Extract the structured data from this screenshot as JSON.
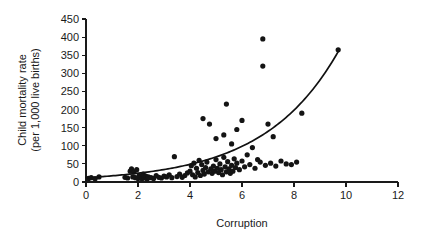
{
  "chart_data": {
    "type": "scatter",
    "title": "",
    "xlabel": "Corruption",
    "ylabel": "Child mortality rate (per 1,000 live births)",
    "ylabel_line1": "Child mortality rate",
    "ylabel_line2": "(per 1,000 live births)",
    "xlim": [
      0,
      12
    ],
    "ylim": [
      0,
      450
    ],
    "xticks": [
      0,
      2,
      4,
      6,
      8,
      10,
      12
    ],
    "yticks": [
      0,
      50,
      100,
      150,
      200,
      250,
      300,
      350,
      400,
      450
    ],
    "xticklabels": [
      "0",
      "2",
      "4",
      "6",
      "8",
      "10",
      "12"
    ],
    "yticklabels": [
      "0",
      "50",
      "100",
      "150",
      "200",
      "250",
      "300",
      "350",
      "400",
      "450"
    ],
    "grid": false,
    "legend": false,
    "point_color": "#141414",
    "curve_color": "#111111",
    "marker_size": 2.6,
    "points": [
      [
        0.1,
        10
      ],
      [
        0.2,
        12
      ],
      [
        0.35,
        9
      ],
      [
        0.5,
        14
      ],
      [
        1.5,
        13
      ],
      [
        1.6,
        11
      ],
      [
        1.7,
        30
      ],
      [
        1.75,
        36
      ],
      [
        1.8,
        14
      ],
      [
        1.85,
        28
      ],
      [
        1.9,
        12
      ],
      [
        1.95,
        34
      ],
      [
        2.0,
        10
      ],
      [
        2.05,
        18
      ],
      [
        2.1,
        13
      ],
      [
        2.15,
        9
      ],
      [
        2.2,
        22
      ],
      [
        2.25,
        11
      ],
      [
        2.3,
        16
      ],
      [
        2.35,
        8
      ],
      [
        2.4,
        14
      ],
      [
        2.5,
        12
      ],
      [
        2.6,
        10
      ],
      [
        2.7,
        18
      ],
      [
        2.8,
        13
      ],
      [
        2.9,
        11
      ],
      [
        3.0,
        16
      ],
      [
        3.1,
        14
      ],
      [
        3.2,
        20
      ],
      [
        3.3,
        12
      ],
      [
        3.4,
        70
      ],
      [
        3.5,
        15
      ],
      [
        3.6,
        22
      ],
      [
        3.7,
        13
      ],
      [
        3.8,
        18
      ],
      [
        3.9,
        25
      ],
      [
        4.0,
        30
      ],
      [
        4.05,
        45
      ],
      [
        4.1,
        20
      ],
      [
        4.15,
        52
      ],
      [
        4.2,
        14
      ],
      [
        4.25,
        38
      ],
      [
        4.3,
        26
      ],
      [
        4.35,
        60
      ],
      [
        4.4,
        18
      ],
      [
        4.45,
        48
      ],
      [
        4.5,
        175
      ],
      [
        4.5,
        32
      ],
      [
        4.55,
        22
      ],
      [
        4.6,
        40
      ],
      [
        4.65,
        55
      ],
      [
        4.7,
        28
      ],
      [
        4.75,
        160
      ],
      [
        4.8,
        36
      ],
      [
        4.85,
        24
      ],
      [
        4.9,
        44
      ],
      [
        4.95,
        30
      ],
      [
        5.0,
        120
      ],
      [
        5.0,
        62
      ],
      [
        5.05,
        38
      ],
      [
        5.1,
        26
      ],
      [
        5.15,
        50
      ],
      [
        5.2,
        34
      ],
      [
        5.25,
        20
      ],
      [
        5.3,
        130
      ],
      [
        5.3,
        68
      ],
      [
        5.35,
        42
      ],
      [
        5.4,
        215
      ],
      [
        5.4,
        28
      ],
      [
        5.45,
        56
      ],
      [
        5.5,
        36
      ],
      [
        5.55,
        24
      ],
      [
        5.6,
        105
      ],
      [
        5.6,
        46
      ],
      [
        5.65,
        30
      ],
      [
        5.7,
        64
      ],
      [
        5.75,
        40
      ],
      [
        5.8,
        145
      ],
      [
        5.8,
        52
      ],
      [
        5.9,
        34
      ],
      [
        6.0,
        170
      ],
      [
        6.0,
        58
      ],
      [
        6.1,
        42
      ],
      [
        6.2,
        75
      ],
      [
        6.3,
        48
      ],
      [
        6.4,
        95
      ],
      [
        6.5,
        38
      ],
      [
        6.6,
        62
      ],
      [
        6.7,
        55
      ],
      [
        6.8,
        395
      ],
      [
        6.8,
        320
      ],
      [
        6.9,
        46
      ],
      [
        7.0,
        160
      ],
      [
        7.1,
        52
      ],
      [
        7.2,
        125
      ],
      [
        7.3,
        44
      ],
      [
        7.5,
        58
      ],
      [
        7.7,
        50
      ],
      [
        7.9,
        48
      ],
      [
        8.1,
        55
      ],
      [
        8.3,
        190
      ],
      [
        9.7,
        365
      ]
    ],
    "curve": {
      "description": "fitted exponential trend line",
      "x_start": 0.0,
      "x_end": 9.7,
      "y_start": 12,
      "y_end": 360,
      "model": "y = 12 * exp(0.351 * x)"
    }
  }
}
